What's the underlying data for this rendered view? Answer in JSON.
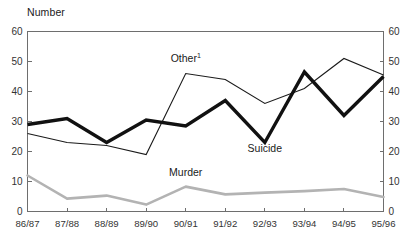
{
  "chart_data": {
    "type": "line",
    "title": "",
    "ylabel": "Number",
    "xlabel": "",
    "ylim": [
      0,
      60
    ],
    "yticks": [
      0,
      10,
      20,
      30,
      40,
      50,
      60
    ],
    "dual_axis": true,
    "right_ylim": [
      0,
      60
    ],
    "right_yticks": [
      0,
      10,
      20,
      30,
      40,
      50,
      60
    ],
    "grid": false,
    "legend_position": "inline-annotations",
    "categories": [
      "86/87",
      "87/88",
      "88/89",
      "89/90",
      "90/91",
      "91/92",
      "92/93",
      "93/94",
      "94/95",
      "95/96"
    ],
    "series": [
      {
        "name": "Other",
        "label": "Other",
        "footnote_marker": "1",
        "style": "thin-black-line",
        "color": "#1a1a1a",
        "values": [
          26,
          23,
          22,
          19,
          46,
          44,
          36,
          41,
          51,
          45.5
        ]
      },
      {
        "name": "Suicide",
        "label": "Suicide",
        "style": "thick-black-line",
        "color": "#111111",
        "values": [
          29,
          31,
          23,
          30.5,
          28.5,
          37,
          23,
          46.5,
          32,
          45
        ]
      },
      {
        "name": "Murder",
        "label": "Murder",
        "style": "thick-gray-line",
        "color": "#b3b3b3",
        "values": [
          12,
          4.3,
          5.3,
          2.3,
          8.3,
          5.7,
          6.3,
          6.8,
          7.5,
          4.8
        ]
      }
    ],
    "annotations": [
      {
        "text": "Other",
        "sup": "1",
        "x_index": 4,
        "value": 50
      },
      {
        "text": "Suicide",
        "x_index": 6,
        "value": 20
      },
      {
        "text": "Murder",
        "x_index": 4,
        "value": 12
      }
    ]
  },
  "colors": {
    "axis": "#6e6e6e",
    "text": "#1a1a1a",
    "suicide": "#111111",
    "other": "#1a1a1a",
    "murder": "#b3b3b3",
    "background": "#ffffff"
  }
}
